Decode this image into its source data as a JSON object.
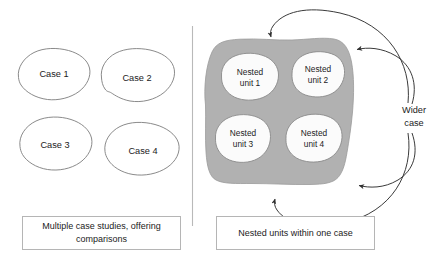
{
  "figure": {
    "background_color": "#ffffff",
    "divider_color": "#b9b9b9"
  },
  "colors": {
    "wider_case_fill": "#b1b1b1",
    "nested_unit_fill": "#fbfbfb",
    "case_outline": "#7d7d7d",
    "arrow": "#2f2f2f",
    "caption_border": "#b5b5b5",
    "text": "#1b1b1b"
  },
  "left_panel": {
    "caption": "Multiple case studies, offering comparisons",
    "caption_line1": "Multiple case studies, offering",
    "caption_line2": "comparisons",
    "cases": [
      {
        "label": "Case 1"
      },
      {
        "label": "Case 2"
      },
      {
        "label": "Case 3"
      },
      {
        "label": "Case 4"
      }
    ]
  },
  "right_panel": {
    "caption": "Nested units within one case",
    "wider_case_label_line1": "Wider",
    "wider_case_label_line2": "case",
    "wider_case_label": "Wider case",
    "nested_units": [
      {
        "line1": "Nested",
        "line2": "unit 1"
      },
      {
        "line1": "Nested",
        "line2": "unit 2"
      },
      {
        "line1": "Nested",
        "line2": "unit 3"
      },
      {
        "line1": "Nested",
        "line2": "unit 4"
      }
    ],
    "arrow_count": 4
  }
}
